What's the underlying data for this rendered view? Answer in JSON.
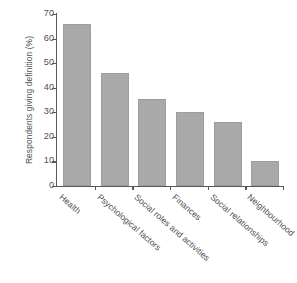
{
  "chart_data": {
    "type": "bar",
    "title": "",
    "subtitle": "",
    "xlabel": "",
    "ylabel": "Respondents giving definition (%)",
    "categories": [
      "Health",
      "Psychological factors",
      "Social roles and activities",
      "Finances",
      "Social relationships",
      "Neighbourhood"
    ],
    "values": [
      66,
      46,
      35.5,
      30,
      26,
      10
    ],
    "ylim": [
      0,
      70
    ],
    "ytick_labels": [
      "70",
      "60",
      "50",
      "40",
      "30",
      "20",
      "10",
      "0"
    ],
    "ytick_values": [
      70,
      60,
      50,
      40,
      30,
      20,
      10,
      0
    ],
    "ytick_step": 10,
    "grid": false,
    "legend": false,
    "legend_position": "none",
    "colors": {
      "bar_fill": "#a9a9a9",
      "bar_edge": "#9d9d9d",
      "axis": "#585858",
      "text": "#4f4f4f",
      "background": "#ffffff"
    }
  }
}
